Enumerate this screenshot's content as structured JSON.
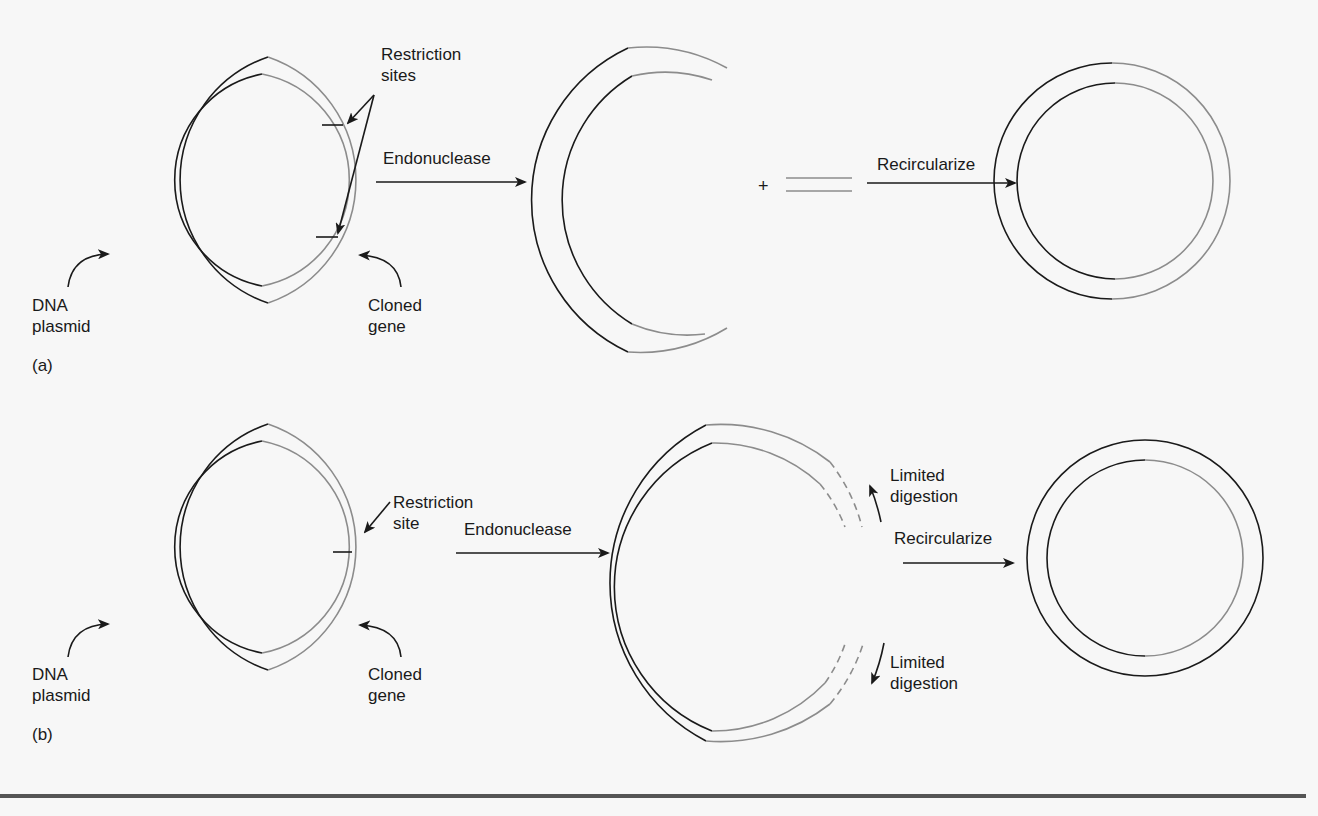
{
  "figure": {
    "colors": {
      "background": "#f7f7f7",
      "dark_strand": "#1a1a1a",
      "gray_strand": "#8c8c8c",
      "rule": "#555555"
    },
    "panel_a": {
      "tag": "(a)",
      "restriction_label_1": "Restriction",
      "restriction_label_2": "sites",
      "plasmid_label_1": "DNA",
      "plasmid_label_2": "plasmid",
      "gene_label_1": "Cloned",
      "gene_label_2": "gene",
      "step1_label": "Endonuclease",
      "plus": "+",
      "step2_label": "Recircularize"
    },
    "panel_b": {
      "tag": "(b)",
      "restriction_label_1": "Restriction",
      "restriction_label_2": "site",
      "plasmid_label_1": "DNA",
      "plasmid_label_2": "plasmid",
      "gene_label_1": "Cloned",
      "gene_label_2": "gene",
      "step1_label": "Endonuclease",
      "digestion_top_1": "Limited",
      "digestion_top_2": "digestion",
      "digestion_bottom_1": "Limited",
      "digestion_bottom_2": "digestion",
      "step2_label": "Recircularize"
    }
  }
}
